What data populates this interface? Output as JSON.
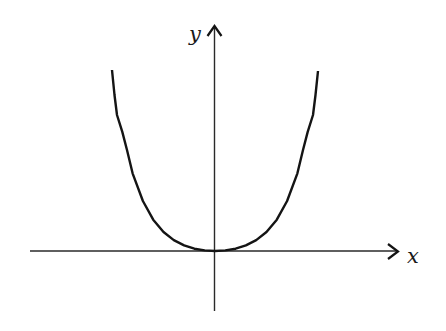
{
  "figure": {
    "axes": {
      "x_label": "x",
      "y_label": "y"
    },
    "colors": {
      "background": "#ffffff",
      "axis": "#2a2a2a",
      "curve": "#141414"
    }
  }
}
